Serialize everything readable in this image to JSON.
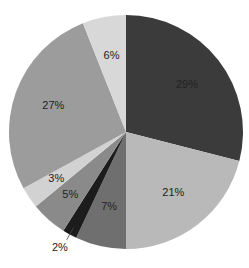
{
  "chart_data": {
    "type": "pie",
    "title": "",
    "start_angle": "12 o'clock",
    "direction": "clockwise",
    "slices": [
      {
        "label": "29%",
        "value": 29,
        "color": "#3b3b3b"
      },
      {
        "label": "21%",
        "value": 21,
        "color": "#b9b9b9"
      },
      {
        "label": "7%",
        "value": 7,
        "color": "#6f6f6f"
      },
      {
        "label": "2%",
        "value": 2,
        "color": "#1c1c1c"
      },
      {
        "label": "5%",
        "value": 5,
        "color": "#8a8a8a"
      },
      {
        "label": "3%",
        "value": 3,
        "color": "#d2d2d2"
      },
      {
        "label": "27%",
        "value": 27,
        "color": "#9c9c9c"
      },
      {
        "label": "6%",
        "value": 6,
        "color": "#d8d8d8"
      }
    ],
    "legend": "none"
  }
}
